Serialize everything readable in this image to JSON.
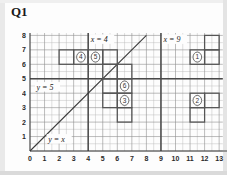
{
  "title": "Q1",
  "axes": {
    "x_label": "x",
    "y_label": "y",
    "x_ticks": [
      "0",
      "1",
      "2",
      "3",
      "4",
      "5",
      "6",
      "7",
      "8",
      "9",
      "10",
      "11",
      "12",
      "13"
    ],
    "y_ticks": [
      "1",
      "2",
      "3",
      "4",
      "5",
      "6",
      "7",
      "8"
    ]
  },
  "annotations": {
    "line_x4": "x = 4",
    "line_x9": "x = 9",
    "line_y5": "y = 5",
    "line_yx": "y = x"
  },
  "shape_labels": {
    "s1": "1",
    "s2": "2",
    "s3": "3",
    "s4": "4",
    "s5": "5",
    "s6": "6"
  },
  "chart_data": {
    "type": "scatter",
    "title": "Q1",
    "xlabel": "x",
    "ylabel": "y",
    "xlim": [
      0,
      13
    ],
    "ylim": [
      0,
      8
    ],
    "grid": true,
    "minor_grid_step": 0.5,
    "major_grid_step": 1,
    "legend": "none",
    "reference_lines": [
      {
        "label": "x = 4",
        "type": "vertical",
        "value": 4
      },
      {
        "label": "x = 9",
        "type": "vertical",
        "value": 9
      },
      {
        "label": "y = 5",
        "type": "horizontal",
        "value": 5
      },
      {
        "label": "y = x",
        "type": "diagonal",
        "slope": 1,
        "intercept": 0,
        "from": [
          0,
          0
        ],
        "to": [
          8,
          8
        ]
      }
    ],
    "shapes": [
      {
        "id": "1",
        "label": "1",
        "outline": [
          [
            11,
            6
          ],
          [
            12,
            6
          ],
          [
            12,
            7
          ],
          [
            13,
            7
          ],
          [
            13,
            8
          ],
          [
            12,
            8
          ],
          [
            12,
            7
          ],
          [
            11,
            7
          ]
        ],
        "cells": [
          [
            11,
            6,
            12,
            7
          ],
          [
            12,
            7,
            13,
            8
          ],
          [
            12,
            6,
            13,
            7
          ]
        ],
        "label_at": [
          11.5,
          6.5
        ]
      },
      {
        "id": "2",
        "label": "2",
        "outline": [
          [
            11,
            2
          ],
          [
            12,
            2
          ],
          [
            12,
            3
          ],
          [
            13,
            3
          ],
          [
            13,
            4
          ],
          [
            11,
            4
          ]
        ],
        "cells": [
          [
            11,
            3,
            12,
            4
          ],
          [
            12,
            3,
            13,
            4
          ],
          [
            11,
            2,
            12,
            3
          ]
        ],
        "label_at": [
          11.5,
          3.5
        ]
      },
      {
        "id": "3",
        "label": "3",
        "outline": [
          [
            5,
            3
          ],
          [
            5,
            4
          ],
          [
            7,
            4
          ],
          [
            7,
            2
          ],
          [
            6,
            2
          ],
          [
            6,
            3
          ]
        ],
        "cells": [
          [
            5,
            3,
            6,
            4
          ],
          [
            6,
            3,
            7,
            4
          ],
          [
            6,
            2,
            7,
            3
          ]
        ],
        "label_at": [
          6.5,
          3.5
        ]
      },
      {
        "id": "4",
        "label": "4",
        "outline": [
          [
            2,
            6
          ],
          [
            4,
            6
          ],
          [
            4,
            7
          ],
          [
            2,
            7
          ]
        ],
        "cells": [
          [
            2,
            6,
            3,
            7
          ],
          [
            3,
            6,
            4,
            7
          ]
        ],
        "label_at": [
          3.5,
          6.5
        ]
      },
      {
        "id": "5",
        "label": "5",
        "outline": [
          [
            4,
            6
          ],
          [
            6,
            6
          ],
          [
            6,
            7
          ],
          [
            4,
            7
          ]
        ],
        "cells": [
          [
            4,
            6,
            5,
            7
          ],
          [
            5,
            6,
            6,
            7
          ]
        ],
        "label_at": [
          4.5,
          6.5
        ]
      },
      {
        "id": "6",
        "label": "6",
        "outline": [
          [
            5,
            4
          ],
          [
            7,
            4
          ],
          [
            7,
            6
          ],
          [
            5,
            6
          ]
        ],
        "cells": [
          [
            5,
            5,
            6,
            6
          ],
          [
            6,
            5,
            7,
            6
          ],
          [
            5,
            4,
            6,
            5
          ],
          [
            6,
            4,
            7,
            5
          ]
        ],
        "label_at": [
          6.5,
          4.5
        ]
      }
    ]
  }
}
